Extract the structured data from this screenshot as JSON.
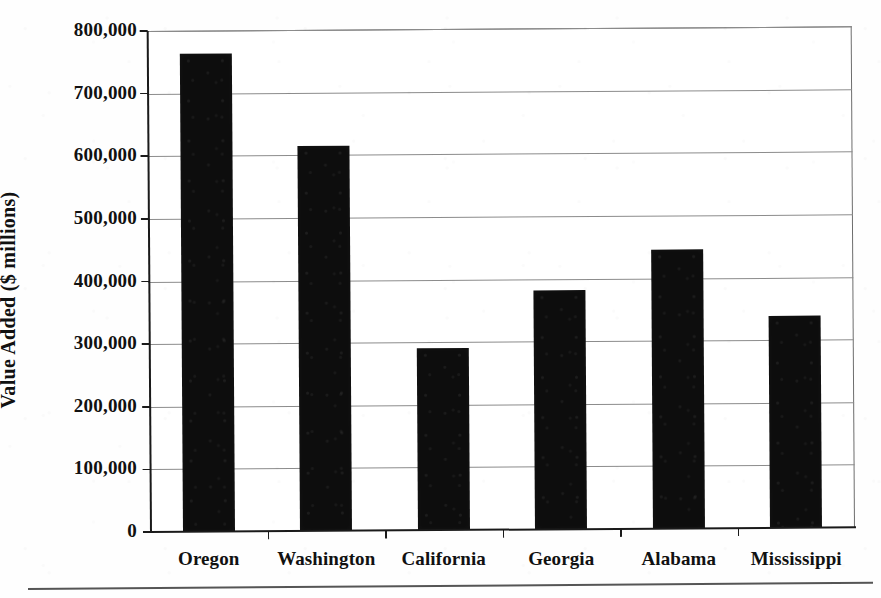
{
  "chart_data": {
    "type": "bar",
    "title": "",
    "xlabel": "",
    "ylabel": "Value Added ($ millions)",
    "categories": [
      "Oregon",
      "Washington",
      "California",
      "Georgia",
      "Alabama",
      "Mississippi"
    ],
    "values": [
      763000,
      614000,
      291000,
      381000,
      446000,
      339000
    ],
    "ylim": [
      0,
      800000
    ],
    "ytick_values": [
      0,
      100000,
      200000,
      300000,
      400000,
      500000,
      600000,
      700000,
      800000
    ],
    "ytick_labels": [
      "0",
      "100,000",
      "200,000",
      "300,000",
      "400,000",
      "500,000",
      "600,000",
      "700,000",
      "800,000"
    ],
    "grid": true,
    "legend": null,
    "bar_color": "#0d0d0d",
    "plot_background": "#ffffff",
    "gridline_color": "#8c8c8c",
    "axis_color": "#1a1a1a"
  },
  "figure": {
    "y_axis_title": "Value Added ($ millions)",
    "has_bottom_rule": true
  }
}
